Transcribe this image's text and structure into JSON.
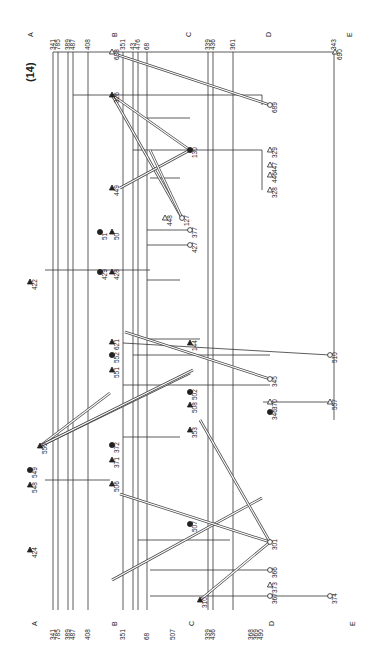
{
  "page": {
    "number_label": "(14)"
  },
  "regions": [
    "A",
    "B",
    "C",
    "D",
    "E"
  ],
  "bus_labels": {
    "A": [
      "341",
      "785",
      "389",
      "487",
      "408"
    ],
    "B": [
      "351",
      "43",
      "476",
      "68"
    ],
    "C_top": [
      "339",
      "436",
      "361"
    ],
    "C_bottom": [
      "507",
      "339",
      "436"
    ],
    "D_bottom": [
      "368",
      "369",
      "490"
    ],
    "D_top": [
      "343"
    ]
  },
  "nodes": [
    {
      "id": "688",
      "type": "open-triangle"
    },
    {
      "id": "326",
      "type": "filled-triangle"
    },
    {
      "id": "690",
      "type": "open-triangle"
    },
    {
      "id": "689",
      "type": "open-circle"
    },
    {
      "id": "130",
      "type": "filled-circle"
    },
    {
      "id": "329",
      "type": "open-triangle"
    },
    {
      "id": "447",
      "type": "open-triangle"
    },
    {
      "id": "446",
      "type": "open-triangle"
    },
    {
      "id": "328",
      "type": "open-triangle"
    },
    {
      "id": "449",
      "type": "filled-triangle"
    },
    {
      "id": "127",
      "type": "open-circle"
    },
    {
      "id": "448",
      "type": "open-triangle"
    },
    {
      "id": "50",
      "type": "filled-triangle"
    },
    {
      "id": "51",
      "type": "filled-circle"
    },
    {
      "id": "427",
      "type": "open-circle"
    },
    {
      "id": "377",
      "type": "open-circle"
    },
    {
      "id": "428",
      "type": "filled-triangle"
    },
    {
      "id": "429",
      "type": "filled-circle"
    },
    {
      "id": "422",
      "type": "filled-triangle"
    },
    {
      "id": "621",
      "type": "filled-triangle"
    },
    {
      "id": "552",
      "type": "filled-circle"
    },
    {
      "id": "551",
      "type": "filled-triangle"
    },
    {
      "id": "144",
      "type": "filled-triangle"
    },
    {
      "id": "502",
      "type": "filled-circle"
    },
    {
      "id": "508",
      "type": "filled-triangle"
    },
    {
      "id": "510",
      "type": "open-circle"
    },
    {
      "id": "345",
      "type": "open-circle"
    },
    {
      "id": "370",
      "type": "open-triangle"
    },
    {
      "id": "346",
      "type": "filled-circle"
    },
    {
      "id": "557",
      "type": "open-triangle"
    },
    {
      "id": "550",
      "type": "filled-triangle"
    },
    {
      "id": "372",
      "type": "filled-circle"
    },
    {
      "id": "371",
      "type": "filled-triangle"
    },
    {
      "id": "353",
      "type": "filled-triangle"
    },
    {
      "id": "549",
      "type": "filled-circle"
    },
    {
      "id": "548",
      "type": "filled-triangle"
    },
    {
      "id": "506",
      "type": "filled-triangle"
    },
    {
      "id": "507",
      "type": "filled-circle"
    },
    {
      "id": "424",
      "type": "filled-triangle"
    },
    {
      "id": "301",
      "type": "open-circle"
    },
    {
      "id": "366",
      "type": "open-circle"
    },
    {
      "id": "373",
      "type": "open-triangle"
    },
    {
      "id": "367",
      "type": "open-circle"
    },
    {
      "id": "374",
      "type": "open-circle"
    },
    {
      "id": "310",
      "type": "filled-triangle"
    }
  ]
}
